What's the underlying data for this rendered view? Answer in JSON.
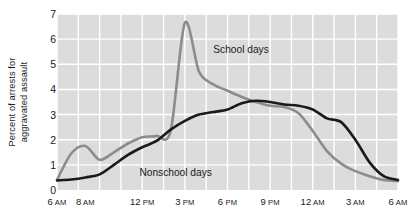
{
  "chart_data": {
    "type": "line",
    "title": "",
    "xlabel": "",
    "ylabel": "Percent of arrests for aggravated assault",
    "ylabel_line1": "Percent of arrests for",
    "ylabel_line2": "aggravated assault",
    "ylim": [
      0,
      7
    ],
    "yticks": [
      0,
      1,
      2,
      3,
      4,
      5,
      6,
      7
    ],
    "xlim": [
      6,
      30
    ],
    "grid": true,
    "grid_color": "#ffffff",
    "plot_background": "#dcdcdc",
    "legend_position": "inline-annotation",
    "xticks": [
      {
        "hour": 6,
        "value": "6",
        "suffix": "AM"
      },
      {
        "hour": 8,
        "value": "8",
        "suffix": "AM"
      },
      {
        "hour": 12,
        "value": "12",
        "suffix": "PM"
      },
      {
        "hour": 15,
        "value": "3",
        "suffix": "PM"
      },
      {
        "hour": 18,
        "value": "6",
        "suffix": "PM"
      },
      {
        "hour": 21,
        "value": "9",
        "suffix": "PM"
      },
      {
        "hour": 24,
        "value": "12",
        "suffix": "AM"
      },
      {
        "hour": 27,
        "value": "3",
        "suffix": "AM"
      },
      {
        "hour": 30,
        "value": "6",
        "suffix": "AM"
      }
    ],
    "x": [
      6,
      7,
      8,
      9,
      10,
      11,
      12,
      13,
      14,
      15,
      16,
      17,
      18,
      19,
      20,
      21,
      22,
      23,
      24,
      25,
      26,
      27,
      28,
      29,
      30
    ],
    "series": [
      {
        "name": "School days",
        "color": "#8c8c8c",
        "label_x_hour": 17.0,
        "label_y_value": 5.55,
        "values": [
          0.4,
          1.45,
          1.75,
          1.2,
          1.5,
          1.85,
          2.1,
          2.15,
          2.35,
          6.65,
          4.7,
          4.2,
          3.95,
          3.7,
          3.5,
          3.35,
          3.3,
          3.05,
          2.35,
          1.55,
          1.05,
          0.75,
          0.55,
          0.4,
          0.35
        ]
      },
      {
        "name": "Nonschool days",
        "color": "#1a1a1a",
        "label_x_hour": 11.8,
        "label_y_value": 0.68,
        "values": [
          0.38,
          0.42,
          0.5,
          0.62,
          1.0,
          1.4,
          1.7,
          1.95,
          2.4,
          2.75,
          3.0,
          3.1,
          3.2,
          3.45,
          3.55,
          3.5,
          3.4,
          3.35,
          3.2,
          2.85,
          2.7,
          2.0,
          1.1,
          0.55,
          0.4
        ]
      }
    ]
  }
}
